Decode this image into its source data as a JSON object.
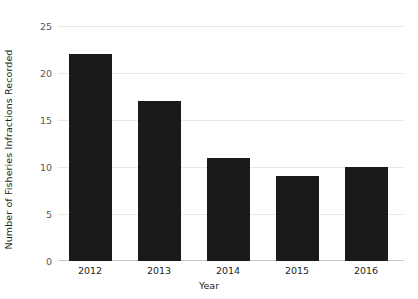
{
  "chart_data": {
    "type": "bar",
    "title": "",
    "xlabel": "Year",
    "ylabel": "Number of Fisheries Infractions Recorded",
    "categories": [
      "2012",
      "2013",
      "2014",
      "2015",
      "2016"
    ],
    "values": [
      22,
      17,
      11,
      9,
      10
    ],
    "series": [
      {
        "name": "Fisheries Infractions Recorded",
        "values": [
          22,
          17,
          11,
          9,
          10
        ]
      }
    ],
    "ylim": [
      0,
      25
    ],
    "yticks": [
      0,
      5,
      10,
      15,
      20,
      25
    ],
    "ytick_labels": [
      "0",
      "5",
      "10",
      "15",
      "20",
      "25"
    ],
    "grid": true,
    "grid_axis": "y",
    "legend": false,
    "legend_position": "none",
    "bar_color": "#1a1a1a",
    "background_color": "#ffffff",
    "gridline_color": "#e8e8e8",
    "axis_text_color": "#231f20",
    "tick_text_color": "#58595b"
  }
}
